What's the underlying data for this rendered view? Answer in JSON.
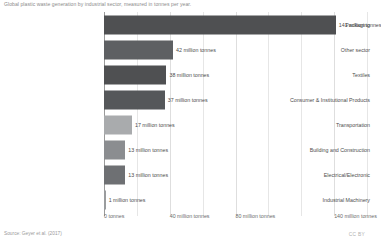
{
  "subtitle": "Global plastic waste generation by industrial sector, measured in tonnes per year.",
  "source": "Source: Geyer et al. (2017)",
  "license": "CC BY",
  "chart_data": {
    "type": "bar",
    "orientation": "horizontal",
    "title": "",
    "subtitle": "Global plastic waste generation by industrial sector, measured in tonnes per year.",
    "xlabel": "",
    "ylabel": "",
    "unit": "million tonnes",
    "xlim": [
      0,
      160
    ],
    "grid": true,
    "legend": false,
    "categories": [
      "Packaging",
      "Other sector",
      "Textiles",
      "Consumer & Institutional Products",
      "Transportation",
      "Building and Construction",
      "Electrical/Electronic",
      "Industrial Machinery"
    ],
    "values": [
      141,
      42,
      38,
      37,
      17,
      13,
      13,
      1
    ],
    "value_labels": [
      "141 million tonnes",
      "42 million tonnes",
      "38 million tonnes",
      "37 million tonnes",
      "17 million tonnes",
      "13 million tonnes",
      "13 million tonnes",
      "1 million tonnes"
    ],
    "bar_colors": [
      "#4f5052",
      "#5e6063",
      "#4f5052",
      "#55575a",
      "#a9abad",
      "#8b8d90",
      "#6e7073",
      "#9a9c9e"
    ],
    "xticks": [
      0,
      40,
      80,
      140
    ],
    "xtick_labels": [
      "0 tonnes",
      "40 million tonnes",
      "80 million tonnes",
      "140 million tonnes"
    ],
    "minor_gridlines": [
      20,
      60,
      100,
      120,
      160
    ]
  }
}
